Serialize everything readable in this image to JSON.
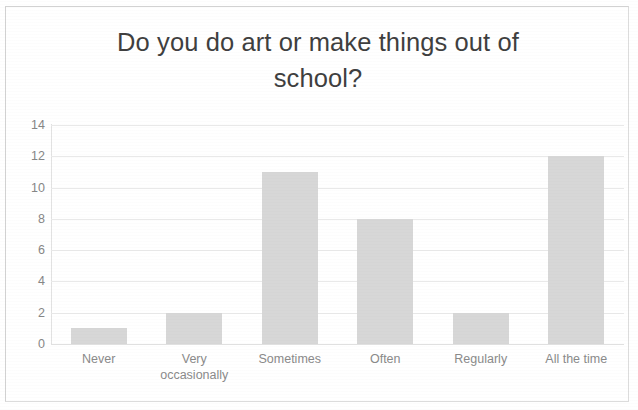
{
  "chart_data": {
    "type": "bar",
    "title": "Do you do art or make things out of\nschool?",
    "title_line1": "Do you do art or make things out of",
    "title_line2": "school?",
    "categories": [
      "Never",
      "Very\noccasionally",
      "Sometimes",
      "Often",
      "Regularly",
      "All the time"
    ],
    "category_labels_flat": [
      "Never",
      "Very occasionally",
      "Sometimes",
      "Often",
      "Regularly",
      "All the time"
    ],
    "values": [
      1,
      2,
      11,
      8,
      2,
      12
    ],
    "xlabel": "",
    "ylabel": "",
    "ylim": [
      0,
      14
    ],
    "ytick_labels": [
      "14",
      "12",
      "10",
      "8",
      "6",
      "4",
      "2",
      "0"
    ],
    "ytick_values": [
      14,
      12,
      10,
      8,
      6,
      4,
      2,
      0
    ],
    "ytick_step": 2,
    "grid": true,
    "grid_axis": "y",
    "legend": false,
    "legend_position": "none",
    "colors": {
      "bar_fill": "#d7d7d7",
      "gridline": "#e9e9e9",
      "axis_line": "#e2e2e2",
      "title_text": "#3f3f3f",
      "tick_text": "#8a8a8a",
      "frame_border": "#dcdcdc",
      "background": "#ffffff"
    }
  }
}
